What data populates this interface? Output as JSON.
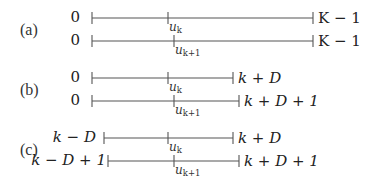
{
  "figure": {
    "rows": [
      {
        "label": "(a)",
        "lines": [
          {
            "left": "0",
            "tick": "u",
            "tick_sub": "k",
            "right": "K − 1"
          },
          {
            "left": "0",
            "tick": "u",
            "tick_sub": "k+1",
            "right": "K − 1"
          }
        ]
      },
      {
        "label": "(b)",
        "lines": [
          {
            "left": "0",
            "tick": "u",
            "tick_sub": "k",
            "right": "k + D"
          },
          {
            "left": "0",
            "tick": "u",
            "tick_sub": "k+1",
            "right": "k + D + 1"
          }
        ]
      },
      {
        "label": "(c)",
        "lines": [
          {
            "left": "k − D",
            "tick": "u",
            "tick_sub": "k",
            "right": "k + D"
          },
          {
            "left": "k − D + 1",
            "tick": "u",
            "tick_sub": "k+1",
            "right": "k + D + 1"
          }
        ]
      }
    ]
  }
}
